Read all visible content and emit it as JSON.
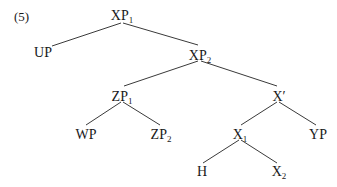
{
  "example_number": "(5)",
  "nodes": [
    {
      "id": "xp1",
      "label": "XP",
      "sub": "1",
      "x": 122,
      "y": 9
    },
    {
      "id": "up",
      "label": "UP",
      "sub": "",
      "x": 43,
      "y": 46
    },
    {
      "id": "xp2",
      "label": "XP",
      "sub": "2",
      "x": 200,
      "y": 49
    },
    {
      "id": "zp1",
      "label": "ZP",
      "sub": "1",
      "x": 122,
      "y": 90
    },
    {
      "id": "xbar",
      "label": "X′",
      "sub": "",
      "x": 279,
      "y": 90
    },
    {
      "id": "wp",
      "label": "WP",
      "sub": "",
      "x": 86,
      "y": 128
    },
    {
      "id": "zp2",
      "label": "ZP",
      "sub": "2",
      "x": 161,
      "y": 128
    },
    {
      "id": "x1",
      "label": "X",
      "sub": "1",
      "x": 240,
      "y": 128
    },
    {
      "id": "yp",
      "label": "YP",
      "sub": "",
      "x": 318,
      "y": 128
    },
    {
      "id": "h",
      "label": "H",
      "sub": "",
      "x": 202,
      "y": 165
    },
    {
      "id": "x2",
      "label": "X",
      "sub": "2",
      "x": 279,
      "y": 165
    }
  ],
  "edges": [
    {
      "from": "xp1",
      "to": "up",
      "x1": 121,
      "y1": 23,
      "x2": 52,
      "y2": 46
    },
    {
      "from": "xp1",
      "to": "xp2",
      "x1": 123,
      "y1": 23,
      "x2": 198,
      "y2": 45
    },
    {
      "from": "xp2",
      "to": "zp1",
      "x1": 198,
      "y1": 61,
      "x2": 124,
      "y2": 86
    },
    {
      "from": "xp2",
      "to": "xbar",
      "x1": 201,
      "y1": 61,
      "x2": 277,
      "y2": 86
    },
    {
      "from": "zp1",
      "to": "wp",
      "x1": 121,
      "y1": 102,
      "x2": 86,
      "y2": 125
    },
    {
      "from": "zp1",
      "to": "zp2",
      "x1": 123,
      "y1": 102,
      "x2": 160,
      "y2": 125
    },
    {
      "from": "xbar",
      "to": "x1",
      "x1": 277,
      "y1": 102,
      "x2": 241,
      "y2": 125
    },
    {
      "from": "xbar",
      "to": "yp",
      "x1": 279,
      "y1": 102,
      "x2": 316,
      "y2": 125
    },
    {
      "from": "x1",
      "to": "h",
      "x1": 239,
      "y1": 140,
      "x2": 203,
      "y2": 163
    },
    {
      "from": "x1",
      "to": "x2",
      "x1": 241,
      "y1": 140,
      "x2": 277,
      "y2": 163
    }
  ]
}
